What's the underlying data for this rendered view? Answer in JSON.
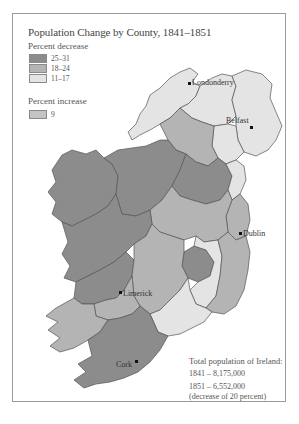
{
  "map": {
    "title": "Population Change by County, 1841–1851",
    "legend": {
      "decrease_heading": "Percent decrease",
      "decrease_classes": [
        {
          "label": "25–31",
          "color": "#8c8c8c"
        },
        {
          "label": "18–24",
          "color": "#b4b4b4"
        },
        {
          "label": "11–17",
          "color": "#e4e4e4"
        }
      ],
      "increase_heading": "Percent increase",
      "increase_classes": [
        {
          "label": "9",
          "color": "#c4c4c4"
        }
      ]
    },
    "cities": [
      {
        "name": "Londonderry"
      },
      {
        "name": "Belfast"
      },
      {
        "name": "Dublin"
      },
      {
        "name": "Limerick"
      },
      {
        "name": "Cork"
      }
    ],
    "totals": {
      "heading": "Total population of Ireland:",
      "line_1841": "1841 – 8,175,000",
      "line_1851": "1851 – 6,552,000",
      "note": "(decrease of 20 percent)"
    },
    "colors": {
      "dark": "#8c8c8c",
      "medium": "#b4b4b4",
      "light": "#e4e4e4",
      "increase": "#c4c4c4",
      "border": "#555555"
    }
  }
}
